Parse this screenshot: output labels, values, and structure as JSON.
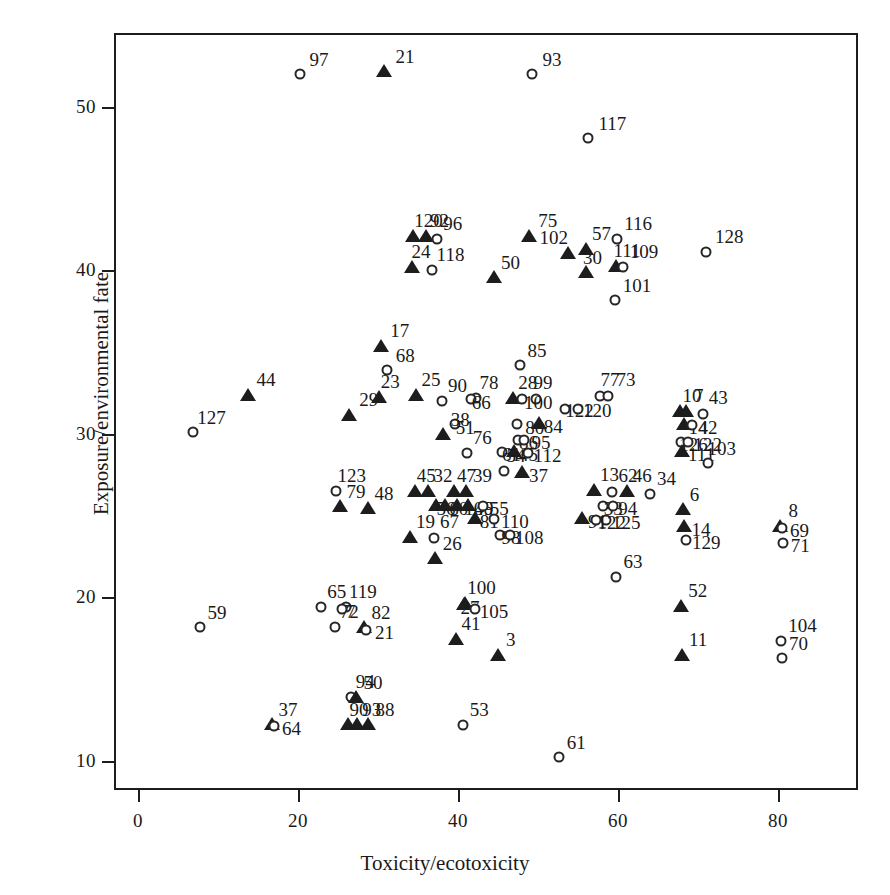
{
  "chart_data": {
    "type": "scatter",
    "title": "",
    "xlabel": "Toxicity/ecotoxicity",
    "ylabel": "Exposure/environmental fate",
    "xlim": [
      -3,
      90
    ],
    "ylim": [
      8.2,
      54.5
    ],
    "xticks": [
      0,
      20,
      40,
      60,
      80
    ],
    "yticks": [
      10,
      20,
      30,
      40,
      50
    ],
    "grid": false,
    "legend": "none",
    "series": [
      {
        "name": "open-circle",
        "marker": "circle"
      },
      {
        "name": "filled-triangle",
        "marker": "triangle"
      }
    ],
    "points": [
      {
        "label": "97",
        "x": 20.2,
        "y": 52.0,
        "m": "circle",
        "lx": 6,
        "ly": -20
      },
      {
        "label": "21",
        "x": 30.8,
        "y": 52.1,
        "m": "triangle",
        "lx": 7,
        "ly": -21
      },
      {
        "label": "93",
        "x": 49.3,
        "y": 52.0,
        "m": "circle",
        "lx": 6,
        "ly": -20
      },
      {
        "label": "117",
        "x": 56.3,
        "y": 48.1,
        "m": "circle",
        "lx": 6,
        "ly": -20
      },
      {
        "label": "120",
        "x": 34.4,
        "y": 42.0,
        "m": "triangle",
        "lx": -3,
        "ly": -22
      },
      {
        "label": "92",
        "x": 36.0,
        "y": 42.0,
        "m": "triangle",
        "lx": 0,
        "ly": -22
      },
      {
        "label": "96",
        "x": 37.4,
        "y": 41.9,
        "m": "circle",
        "lx": 2,
        "ly": -21
      },
      {
        "label": "75",
        "x": 48.9,
        "y": 42.0,
        "m": "triangle",
        "lx": 5,
        "ly": -22
      },
      {
        "label": "116",
        "x": 59.9,
        "y": 41.9,
        "m": "circle",
        "lx": 3,
        "ly": -21
      },
      {
        "label": "128",
        "x": 71.0,
        "y": 41.1,
        "m": "circle",
        "lx": 5,
        "ly": -21
      },
      {
        "label": "57",
        "x": 56.0,
        "y": 41.2,
        "m": "triangle",
        "lx": 2,
        "ly": -22
      },
      {
        "label": "24",
        "x": 34.2,
        "y": 40.1,
        "m": "triangle",
        "lx": -4,
        "ly": -22
      },
      {
        "label": "118",
        "x": 36.7,
        "y": 40.0,
        "m": "circle",
        "lx": 1,
        "ly": -21
      },
      {
        "label": "102",
        "x": 53.7,
        "y": 41.0,
        "m": "triangle",
        "lx": -32,
        "ly": -22
      },
      {
        "label": "111",
        "x": 59.8,
        "y": 40.2,
        "m": "triangle",
        "lx": -7,
        "ly": -22
      },
      {
        "label": "109",
        "x": 60.6,
        "y": 40.2,
        "m": "circle",
        "lx": 3,
        "ly": -21
      },
      {
        "label": "30",
        "x": 56.0,
        "y": 39.8,
        "m": "triangle",
        "lx": -7,
        "ly": -21
      },
      {
        "label": "50",
        "x": 44.5,
        "y": 39.5,
        "m": "triangle",
        "lx": 3,
        "ly": -21
      },
      {
        "label": "101",
        "x": 59.6,
        "y": 38.2,
        "m": "circle",
        "lx": 4,
        "ly": -20
      },
      {
        "label": "17",
        "x": 30.4,
        "y": 35.3,
        "m": "triangle",
        "lx": 5,
        "ly": -22
      },
      {
        "label": "68",
        "x": 31.1,
        "y": 33.9,
        "m": "circle",
        "lx": 5,
        "ly": -20
      },
      {
        "label": "85",
        "x": 47.7,
        "y": 34.2,
        "m": "circle",
        "lx": 4,
        "ly": -20
      },
      {
        "label": "44",
        "x": 13.7,
        "y": 32.3,
        "m": "triangle",
        "lx": 5,
        "ly": -22
      },
      {
        "label": "29",
        "x": 26.4,
        "y": 31.1,
        "m": "triangle",
        "lx": 6,
        "ly": -22
      },
      {
        "label": "23",
        "x": 30.1,
        "y": 32.2,
        "m": "triangle",
        "lx": -2,
        "ly": -22
      },
      {
        "label": "25",
        "x": 34.8,
        "y": 32.3,
        "m": "triangle",
        "lx": 1,
        "ly": -22
      },
      {
        "label": "90",
        "x": 38.0,
        "y": 32.0,
        "m": "circle",
        "lx": 2,
        "ly": -21
      },
      {
        "label": "78",
        "x": 42.2,
        "y": 32.2,
        "m": "circle",
        "lx": 0,
        "ly": -21
      },
      {
        "label": "66",
        "x": 41.6,
        "y": 32.1,
        "m": "circle",
        "lx": -3,
        "ly": -2
      },
      {
        "label": "28",
        "x": 46.9,
        "y": 32.1,
        "m": "triangle",
        "lx": 1,
        "ly": -22
      },
      {
        "label": "99",
        "x": 49.8,
        "y": 32.1,
        "m": "circle",
        "lx": -7,
        "ly": -22
      },
      {
        "label": "100",
        "x": 48.0,
        "y": 32.1,
        "m": "circle",
        "lx": -2,
        "ly": -2
      },
      {
        "label": "77",
        "x": 57.8,
        "y": 32.3,
        "m": "circle",
        "lx": -4,
        "ly": -22
      },
      {
        "label": "73",
        "x": 58.8,
        "y": 32.3,
        "m": "circle",
        "lx": 4,
        "ly": -22
      },
      {
        "label": "122",
        "x": 53.4,
        "y": 31.5,
        "m": "circle",
        "lx": -4,
        "ly": -4
      },
      {
        "label": "120b",
        "x": 55.0,
        "y": 31.5,
        "m": "circle",
        "lx": 1,
        "ly": -4
      },
      {
        "label": "127",
        "x": 6.9,
        "y": 30.1,
        "m": "circle",
        "lx": 0,
        "ly": -20
      },
      {
        "label": "10",
        "x": 67.7,
        "y": 31.3,
        "m": "triangle",
        "lx": -1,
        "ly": -22
      },
      {
        "label": "7",
        "x": 68.5,
        "y": 31.3,
        "m": "triangle",
        "lx": 4,
        "ly": -22
      },
      {
        "label": "43",
        "x": 70.6,
        "y": 31.2,
        "m": "circle",
        "lx": 2,
        "ly": -22
      },
      {
        "label": "51",
        "x": 39.6,
        "y": 30.6,
        "m": "circle",
        "lx": -3,
        "ly": -2
      },
      {
        "label": "80",
        "x": 47.4,
        "y": 30.6,
        "m": "circle",
        "lx": 4,
        "ly": -2
      },
      {
        "label": "84",
        "x": 50.1,
        "y": 30.6,
        "m": "triangle",
        "lx": 1,
        "ly": -3
      },
      {
        "label": "14",
        "x": 68.3,
        "y": 30.5,
        "m": "triangle",
        "lx": 0,
        "ly": -3
      },
      {
        "label": "42",
        "x": 69.2,
        "y": 30.5,
        "m": "circle",
        "lx": 3,
        "ly": -3
      },
      {
        "label": "38",
        "x": 38.1,
        "y": 29.9,
        "m": "triangle",
        "lx": 4,
        "ly": -21
      },
      {
        "label": "86",
        "x": 47.5,
        "y": 29.6,
        "m": "circle",
        "lx": -3,
        "ly": -3
      },
      {
        "label": "95",
        "x": 48.3,
        "y": 29.6,
        "m": "circle",
        "lx": 3,
        "ly": -3
      },
      {
        "label": "126",
        "x": 67.9,
        "y": 29.5,
        "m": "circle",
        "lx": -6,
        "ly": -3
      },
      {
        "label": "122b",
        "x": 68.7,
        "y": 29.5,
        "m": "circle",
        "lx": 2,
        "ly": -3
      },
      {
        "label": "76",
        "x": 41.1,
        "y": 28.8,
        "m": "circle",
        "lx": 2,
        "ly": -21
      },
      {
        "label": "61b",
        "x": 45.5,
        "y": 28.9,
        "m": "circle",
        "lx": -4,
        "ly": -3
      },
      {
        "label": "45b",
        "x": 47.0,
        "y": 28.9,
        "m": "triangle",
        "lx": 1,
        "ly": -3
      },
      {
        "label": "112",
        "x": 48.7,
        "y": 28.8,
        "m": "circle",
        "lx": 2,
        "ly": -3
      },
      {
        "label": "111b",
        "x": 68.0,
        "y": 28.9,
        "m": "triangle",
        "lx": 2,
        "ly": -3
      },
      {
        "label": "103",
        "x": 71.2,
        "y": 28.2,
        "m": "circle",
        "lx": -4,
        "ly": -20
      },
      {
        "label": "54",
        "x": 45.7,
        "y": 27.7,
        "m": "circle",
        "lx": -1,
        "ly": -21
      },
      {
        "label": "37b",
        "x": 48.0,
        "y": 27.6,
        "m": "triangle",
        "lx": 3,
        "ly": -3
      },
      {
        "label": "123",
        "x": 24.8,
        "y": 26.5,
        "m": "circle",
        "lx": -3,
        "ly": -21
      },
      {
        "label": "79",
        "x": 25.3,
        "y": 25.5,
        "m": "triangle",
        "lx": 2,
        "ly": -21
      },
      {
        "label": "48",
        "x": 28.8,
        "y": 25.4,
        "m": "triangle",
        "lx": 2,
        "ly": -21
      },
      {
        "label": "45",
        "x": 34.6,
        "y": 26.4,
        "m": "triangle",
        "lx": -2,
        "ly": -22
      },
      {
        "label": "32",
        "x": 36.2,
        "y": 26.4,
        "m": "triangle",
        "lx": 2,
        "ly": -22
      },
      {
        "label": "47",
        "x": 39.5,
        "y": 26.4,
        "m": "triangle",
        "lx": -1,
        "ly": -22
      },
      {
        "label": "39",
        "x": 41.0,
        "y": 26.4,
        "m": "triangle",
        "lx": 3,
        "ly": -22
      },
      {
        "label": "56",
        "x": 37.3,
        "y": 25.6,
        "m": "triangle",
        "lx": -4,
        "ly": -3
      },
      {
        "label": "60",
        "x": 38.4,
        "y": 25.6,
        "m": "triangle",
        "lx": 0,
        "ly": -3
      },
      {
        "label": "106",
        "x": 39.9,
        "y": 25.6,
        "m": "triangle",
        "lx": 3,
        "ly": -3
      },
      {
        "label": "49",
        "x": 41.3,
        "y": 25.6,
        "m": "triangle",
        "lx": 2,
        "ly": -3
      },
      {
        "label": "55",
        "x": 43.1,
        "y": 25.6,
        "m": "circle",
        "lx": 3,
        "ly": -3
      },
      {
        "label": "13",
        "x": 57.0,
        "y": 26.5,
        "m": "triangle",
        "lx": 2,
        "ly": -22
      },
      {
        "label": "62",
        "x": 59.3,
        "y": 26.4,
        "m": "circle",
        "lx": 2,
        "ly": -22
      },
      {
        "label": "46",
        "x": 61.1,
        "y": 26.4,
        "m": "triangle",
        "lx": 2,
        "ly": -22
      },
      {
        "label": "33",
        "x": 58.1,
        "y": 25.6,
        "m": "circle",
        "lx": -3,
        "ly": -3
      },
      {
        "label": "94b",
        "x": 59.4,
        "y": 25.6,
        "m": "circle",
        "lx": 1,
        "ly": -3
      },
      {
        "label": "34",
        "x": 64.0,
        "y": 26.3,
        "m": "circle",
        "lx": 3,
        "ly": -21
      },
      {
        "label": "8",
        "x": 80.3,
        "y": 24.3,
        "m": "triangle",
        "lx": 4,
        "ly": -22
      },
      {
        "label": "69",
        "x": 80.5,
        "y": 24.2,
        "m": "circle",
        "lx": 4,
        "ly": -3
      },
      {
        "label": "71",
        "x": 80.6,
        "y": 23.3,
        "m": "circle",
        "lx": 4,
        "ly": -3
      },
      {
        "label": "81",
        "x": 42.1,
        "y": 24.8,
        "m": "triangle",
        "lx": 1,
        "ly": -3
      },
      {
        "label": "110",
        "x": 44.5,
        "y": 24.8,
        "m": "circle",
        "lx": 3,
        "ly": -3
      },
      {
        "label": "91",
        "x": 55.5,
        "y": 24.8,
        "m": "triangle",
        "lx": 2,
        "ly": -3
      },
      {
        "label": "125",
        "x": 58.5,
        "y": 24.7,
        "m": "circle",
        "lx": 2,
        "ly": -3
      },
      {
        "label": "122c",
        "x": 57.2,
        "y": 24.7,
        "m": "circle",
        "lx": -2,
        "ly": -3
      },
      {
        "label": "6",
        "x": 68.1,
        "y": 25.3,
        "m": "triangle",
        "lx": 3,
        "ly": -21
      },
      {
        "label": "14b",
        "x": 68.2,
        "y": 24.3,
        "m": "triangle",
        "lx": 4,
        "ly": -3
      },
      {
        "label": "129",
        "x": 68.5,
        "y": 23.5,
        "m": "circle",
        "lx": 2,
        "ly": -3
      },
      {
        "label": "19",
        "x": 34.0,
        "y": 23.6,
        "m": "triangle",
        "lx": 2,
        "ly": -22
      },
      {
        "label": "67",
        "x": 37.0,
        "y": 23.6,
        "m": "circle",
        "lx": 2,
        "ly": -22
      },
      {
        "label": "98",
        "x": 45.2,
        "y": 23.8,
        "m": "circle",
        "lx": -2,
        "ly": -3
      },
      {
        "label": "108",
        "x": 46.5,
        "y": 23.8,
        "m": "circle",
        "lx": 1,
        "ly": -3
      },
      {
        "label": "26",
        "x": 37.1,
        "y": 22.3,
        "m": "triangle",
        "lx": 4,
        "ly": -21
      },
      {
        "label": "63",
        "x": 59.8,
        "y": 21.2,
        "m": "circle",
        "lx": 3,
        "ly": -21
      },
      {
        "label": "59",
        "x": 7.8,
        "y": 18.2,
        "m": "circle",
        "lx": 3,
        "ly": -20
      },
      {
        "label": "65",
        "x": 22.9,
        "y": 19.4,
        "m": "circle",
        "lx": 2,
        "ly": -21
      },
      {
        "label": "119",
        "x": 26.0,
        "y": 19.4,
        "m": "circle",
        "lx": -1,
        "ly": -21
      },
      {
        "label": "72",
        "x": 24.6,
        "y": 18.2,
        "m": "circle",
        "lx": 1,
        "ly": -21
      },
      {
        "label": "7b",
        "x": 25.5,
        "y": 19.3,
        "m": "circle",
        "lx": 0,
        "ly": -3
      },
      {
        "label": "82",
        "x": 28.3,
        "y": 18.1,
        "m": "triangle",
        "lx": 3,
        "ly": -21
      },
      {
        "label": "21b",
        "x": 28.5,
        "y": 18.0,
        "m": "circle",
        "lx": 5,
        "ly": -3
      },
      {
        "label": "100b",
        "x": 40.9,
        "y": 19.6,
        "m": "triangle",
        "lx": -2,
        "ly": -22
      },
      {
        "label": "27",
        "x": 40.8,
        "y": 19.5,
        "m": "triangle",
        "lx": -8,
        "ly": -3
      },
      {
        "label": "105",
        "x": 42.1,
        "y": 19.3,
        "m": "circle",
        "lx": 1,
        "ly": -3
      },
      {
        "label": "41",
        "x": 39.7,
        "y": 17.4,
        "m": "triangle",
        "lx": 2,
        "ly": -22
      },
      {
        "label": "3",
        "x": 45.0,
        "y": 16.4,
        "m": "triangle",
        "lx": 4,
        "ly": -22
      },
      {
        "label": "52",
        "x": 67.9,
        "y": 19.4,
        "m": "triangle",
        "lx": 3,
        "ly": -22
      },
      {
        "label": "11",
        "x": 68.0,
        "y": 16.4,
        "m": "triangle",
        "lx": 3,
        "ly": -22
      },
      {
        "label": "104",
        "x": 80.4,
        "y": 17.3,
        "m": "circle",
        "lx": 3,
        "ly": -21
      },
      {
        "label": "70",
        "x": 80.5,
        "y": 16.3,
        "m": "circle",
        "lx": 3,
        "ly": -20
      },
      {
        "label": "94",
        "x": 26.6,
        "y": 13.9,
        "m": "circle",
        "lx": 1,
        "ly": -21
      },
      {
        "label": "50b",
        "x": 27.2,
        "y": 13.8,
        "m": "triangle",
        "lx": 4,
        "ly": -21
      },
      {
        "label": "37",
        "x": 16.8,
        "y": 12.2,
        "m": "triangle",
        "lx": 2,
        "ly": -21
      },
      {
        "label": "64",
        "x": 17.0,
        "y": 12.1,
        "m": "circle",
        "lx": 4,
        "ly": -3
      },
      {
        "label": "90b",
        "x": 26.2,
        "y": 12.2,
        "m": "triangle",
        "lx": -2,
        "ly": -21
      },
      {
        "label": "93b",
        "x": 27.4,
        "y": 12.2,
        "m": "triangle",
        "lx": 1,
        "ly": -21
      },
      {
        "label": "88",
        "x": 28.8,
        "y": 12.2,
        "m": "triangle",
        "lx": 3,
        "ly": -21
      },
      {
        "label": "53",
        "x": 40.6,
        "y": 12.2,
        "m": "circle",
        "lx": 3,
        "ly": -21
      },
      {
        "label": "61",
        "x": 52.6,
        "y": 10.2,
        "m": "circle",
        "lx": 4,
        "ly": -20
      }
    ],
    "label_overrides": {
      "120b": "120",
      "94b": "94",
      "122b": "122",
      "122c": "122",
      "111b": "111",
      "14b": "14",
      "21b": "21",
      "7b": "7",
      "50b": "50",
      "90b": "90",
      "93b": "93",
      "100b": "100",
      "37b": "37",
      "45b": "45",
      "61b": "61"
    }
  }
}
